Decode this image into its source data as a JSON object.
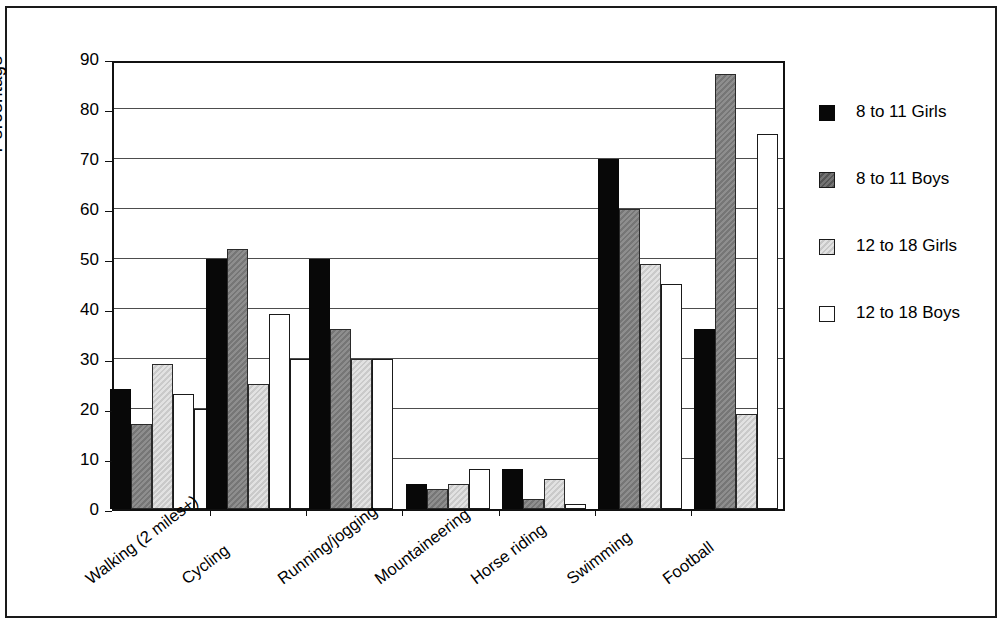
{
  "chart_data": {
    "type": "bar",
    "title": "",
    "xlabel": "",
    "ylabel": "Percentage",
    "ylim": [
      0,
      90
    ],
    "yticks": [
      0,
      10,
      20,
      30,
      40,
      50,
      60,
      70,
      80,
      90
    ],
    "grid": true,
    "legend_position": "right",
    "categories": [
      "Walking (2 miles+)",
      "Cycling",
      "Running/jogging",
      "Mountaineering",
      "Horse riding",
      "Swimming",
      "Football"
    ],
    "series": [
      {
        "name": "8 to 11 Girls",
        "color": "#080808",
        "values": [
          24,
          50,
          50,
          5,
          8,
          70,
          36
        ]
      },
      {
        "name": "8 to 11 Boys",
        "color": "#7d7d7d",
        "values": [
          17,
          52,
          36,
          4,
          2,
          60,
          87
        ]
      },
      {
        "name": "12 to 18 Girls",
        "color": "#d2d2d2",
        "values": [
          29,
          25,
          30,
          5,
          6,
          49,
          19
        ]
      },
      {
        "name": "12 to 18 Boys",
        "color": "#ffffff",
        "values": [
          23,
          39,
          30,
          8,
          1,
          45,
          75
        ]
      }
    ],
    "trailing_values": [
      20,
      30,
      0,
      0,
      0,
      0,
      0
    ]
  },
  "legend": {
    "entries": [
      "8 to 11 Girls",
      "8 to 11 Boys",
      "12 to 18 Girls",
      "12 to 18 Boys"
    ]
  },
  "axis": {
    "y_label": "Percentage",
    "y_tick_labels": [
      "0",
      "10",
      "20",
      "30",
      "40",
      "50",
      "60",
      "70",
      "80",
      "90"
    ]
  }
}
